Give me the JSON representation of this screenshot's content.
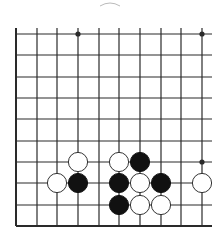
{
  "board": {
    "title": "Go board diagram",
    "colors": {
      "line": "#2a2a2a",
      "black_stone": "#111111",
      "white_stone": "#ffffff",
      "white_outline": "#333333",
      "background": "#ffffff"
    },
    "grid": {
      "x": [
        16,
        37,
        57,
        78,
        99,
        119,
        140,
        161,
        181,
        202
      ],
      "y": [
        34,
        55,
        77,
        98,
        119,
        141,
        162,
        183,
        205,
        226
      ],
      "right_extent": 212,
      "top_extent": 28
    },
    "star_points": [
      {
        "col": 3,
        "row": 0
      },
      {
        "col": 9,
        "row": 0
      },
      {
        "col": 9,
        "row": 6
      }
    ],
    "stones": [
      {
        "color": "white",
        "col": 3,
        "row": 6
      },
      {
        "color": "white",
        "col": 5,
        "row": 6
      },
      {
        "color": "black",
        "col": 6,
        "row": 6
      },
      {
        "color": "white",
        "col": 2,
        "row": 7
      },
      {
        "color": "black",
        "col": 3,
        "row": 7
      },
      {
        "color": "black",
        "col": 5,
        "row": 7
      },
      {
        "color": "white",
        "col": 6,
        "row": 7
      },
      {
        "color": "black",
        "col": 7,
        "row": 7
      },
      {
        "color": "white",
        "col": 9,
        "row": 7
      },
      {
        "color": "black",
        "col": 5,
        "row": 8
      },
      {
        "color": "white",
        "col": 6,
        "row": 8
      },
      {
        "color": "white",
        "col": 7,
        "row": 8
      }
    ]
  }
}
